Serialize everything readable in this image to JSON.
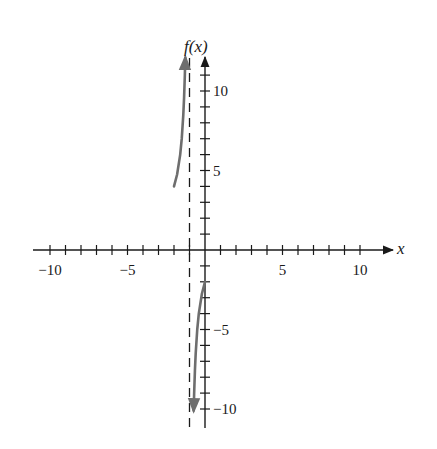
{
  "chart_data": {
    "type": "line",
    "title": "",
    "xlabel": "x",
    "ylabel": "f(x)",
    "xlim": [
      -11,
      12
    ],
    "ylim": [
      -11.5,
      12
    ],
    "grid": false,
    "legend": null,
    "x_ticks": [
      -10,
      -9,
      -8,
      -7,
      -6,
      -5,
      -4,
      -3,
      -2,
      -1,
      1,
      2,
      3,
      4,
      5,
      6,
      7,
      8,
      9,
      10
    ],
    "x_tick_labels": [
      {
        "value": -10,
        "label": "−10"
      },
      {
        "value": -5,
        "label": "−5"
      },
      {
        "value": 5,
        "label": "5"
      },
      {
        "value": 10,
        "label": "10"
      }
    ],
    "y_ticks": [
      -10,
      -9,
      -8,
      -7,
      -6,
      -5,
      -4,
      -3,
      -2,
      -1,
      1,
      2,
      3,
      4,
      5,
      6,
      7,
      8,
      9,
      10,
      11
    ],
    "y_tick_labels": [
      {
        "value": 10,
        "label": "10"
      },
      {
        "value": 5,
        "label": "5"
      },
      {
        "value": -5,
        "label": "−5"
      },
      {
        "value": -10,
        "label": "−10"
      }
    ],
    "asymptotes": [
      {
        "type": "vertical",
        "x": -1,
        "style": "dashed"
      }
    ],
    "series": [
      {
        "name": "f(x) left branch",
        "arrow_end": "up",
        "x": [
          -2.0,
          -1.8,
          -1.6,
          -1.5,
          -1.4,
          -1.35,
          -1.3,
          -1.27
        ],
        "y": [
          4.0,
          4.75,
          6.0,
          7.0,
          8.5,
          9.57,
          11.0,
          12.1
        ]
      },
      {
        "name": "f(x) right branch",
        "arrow_end": "down",
        "x": [
          0.0,
          -0.2,
          -0.4,
          -0.5,
          -0.6,
          -0.65,
          -0.7,
          -0.73
        ],
        "y": [
          -2.0,
          -2.75,
          -4.0,
          -5.0,
          -6.5,
          -7.57,
          -9.0,
          -10.1
        ]
      }
    ],
    "colors": {
      "axes": "#1a1a1a",
      "curve": "#6e6e6e",
      "asymptote": "#1a1a1a"
    }
  }
}
